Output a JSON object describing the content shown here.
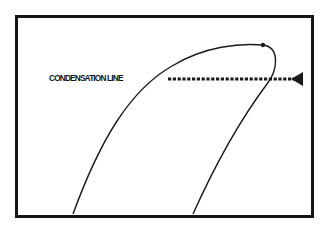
{
  "diagram": {
    "label": "CONDENSATION LINE",
    "colors": {
      "frame": "#151515",
      "curve": "#1a1a1a",
      "dashed_line": "#1a1a1a",
      "background": "#ffffff"
    },
    "elements": {
      "curve": "dome-shaped curve (left and right branches meeting at a peak)",
      "peak_point": "small dot at top of curve",
      "condensation_line": "horizontal dashed line with arrowhead pointing left, crossing the right branch"
    }
  }
}
